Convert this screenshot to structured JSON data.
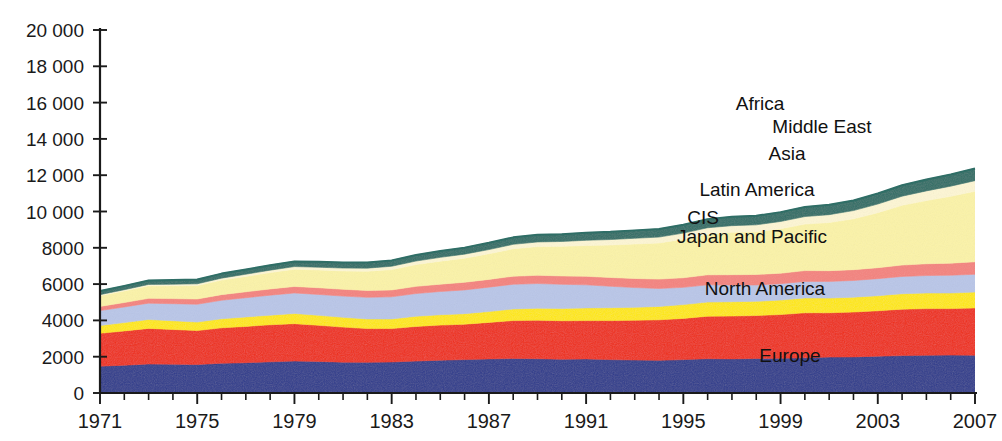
{
  "chart_data": {
    "type": "area",
    "title": "",
    "subtitle": "",
    "xlabel": "",
    "ylabel": "",
    "stacked": true,
    "grid": false,
    "legend_position": "inline-labels",
    "xlim": [
      1971,
      2007
    ],
    "ylim": [
      0,
      20000
    ],
    "ytick_step": 2000,
    "xtick_step": 4,
    "x": [
      1971,
      1972,
      1973,
      1974,
      1975,
      1976,
      1977,
      1978,
      1979,
      1980,
      1981,
      1982,
      1983,
      1984,
      1985,
      1986,
      1987,
      1988,
      1989,
      1990,
      1991,
      1992,
      1993,
      1994,
      1995,
      1996,
      1997,
      1998,
      1999,
      2000,
      2001,
      2002,
      2003,
      2004,
      2005,
      2006,
      2007
    ],
    "xtick_labels": [
      "1971",
      "1975",
      "1979",
      "1983",
      "1987",
      "1991",
      "1995",
      "1999",
      "2003",
      "2007"
    ],
    "ytick_labels": [
      "0",
      "2000",
      "4000",
      "6000",
      "8000",
      "10 000",
      "12 000",
      "14 000",
      "16 000",
      "18 000",
      "20 000"
    ],
    "series": [
      {
        "name": "Europe",
        "color": "#2e3b8c",
        "label_x": 2002,
        "label_y": 1450,
        "values": [
          1480,
          1530,
          1600,
          1590,
          1570,
          1640,
          1670,
          1720,
          1760,
          1740,
          1700,
          1690,
          1710,
          1760,
          1810,
          1840,
          1880,
          1900,
          1890,
          1860,
          1880,
          1840,
          1820,
          1800,
          1840,
          1890,
          1880,
          1900,
          1910,
          1940,
          1980,
          1990,
          2030,
          2060,
          2080,
          2090,
          2080
        ]
      },
      {
        "name": "North America",
        "color": "#ee2d16",
        "label_x": 2001,
        "label_y": 3300,
        "values": [
          1810,
          1890,
          1960,
          1910,
          1870,
          1950,
          2000,
          2040,
          2060,
          1990,
          1930,
          1860,
          1840,
          1910,
          1930,
          1950,
          2010,
          2090,
          2120,
          2120,
          2110,
          2150,
          2190,
          2230,
          2270,
          2340,
          2360,
          2370,
          2410,
          2480,
          2440,
          2470,
          2500,
          2560,
          2570,
          2560,
          2610
        ]
      },
      {
        "name": "Japan and Pacific",
        "color": "#ffe800",
        "label_x": 2000,
        "label_y": 1060,
        "values": [
          430,
          460,
          490,
          480,
          470,
          500,
          520,
          530,
          560,
          550,
          540,
          530,
          530,
          560,
          570,
          580,
          600,
          640,
          660,
          680,
          700,
          710,
          710,
          740,
          760,
          780,
          790,
          780,
          800,
          820,
          810,
          820,
          830,
          850,
          860,
          860,
          870
        ]
      },
      {
        "name": "CIS",
        "color": "#b9c6e8",
        "label_x": 1996,
        "label_y": 1000,
        "values": [
          820,
          860,
          900,
          940,
          980,
          1020,
          1060,
          1100,
          1130,
          1150,
          1170,
          1190,
          1220,
          1250,
          1280,
          1310,
          1340,
          1360,
          1360,
          1330,
          1270,
          1180,
          1090,
          990,
          950,
          950,
          920,
          900,
          900,
          910,
          920,
          920,
          940,
          950,
          960,
          980,
          980
        ]
      },
      {
        "name": "Latin America",
        "color": "#f4837e",
        "label_x": 2000,
        "label_y": 1250,
        "values": [
          230,
          245,
          265,
          280,
          290,
          310,
          325,
          345,
          360,
          370,
          375,
          380,
          380,
          395,
          405,
          420,
          430,
          445,
          455,
          460,
          470,
          485,
          500,
          515,
          530,
          550,
          570,
          580,
          580,
          595,
          590,
          595,
          605,
          630,
          650,
          665,
          690
        ]
      },
      {
        "name": "Asia",
        "color": "#fbf3a8",
        "label_x": 1999,
        "label_y": 2700,
        "values": [
          590,
          640,
          690,
          710,
          740,
          800,
          850,
          900,
          950,
          980,
          1010,
          1060,
          1120,
          1200,
          1270,
          1330,
          1410,
          1510,
          1580,
          1630,
          1700,
          1790,
          1900,
          1990,
          2120,
          2240,
          2330,
          2350,
          2450,
          2560,
          2650,
          2800,
          3030,
          3290,
          3480,
          3680,
          3880
        ]
      },
      {
        "name": "Middle East",
        "color": "#fdf6d4",
        "label_x": 2003,
        "label_y": 1000,
        "values": [
          60,
          68,
          78,
          85,
          95,
          108,
          120,
          133,
          145,
          150,
          158,
          170,
          182,
          195,
          208,
          220,
          232,
          245,
          258,
          268,
          285,
          300,
          315,
          325,
          340,
          355,
          370,
          385,
          400,
          415,
          435,
          455,
          475,
          505,
          535,
          560,
          590
        ]
      },
      {
        "name": "Africa",
        "color": "#2f6e66",
        "label_x": 1996,
        "label_y": 1400,
        "values": [
          200,
          210,
          220,
          230,
          240,
          250,
          262,
          275,
          285,
          295,
          305,
          315,
          325,
          335,
          348,
          360,
          372,
          385,
          395,
          405,
          415,
          425,
          435,
          445,
          460,
          475,
          490,
          500,
          515,
          530,
          545,
          560,
          580,
          605,
          625,
          645,
          670
        ]
      }
    ],
    "series_label_positions": [
      {
        "name": "Africa",
        "x": 760,
        "y": 110
      },
      {
        "name": "Middle East",
        "x": 822,
        "y": 133
      },
      {
        "name": "Asia",
        "x": 787,
        "y": 160
      },
      {
        "name": "Latin America",
        "x": 757,
        "y": 196
      },
      {
        "name": "CIS",
        "x": 703,
        "y": 224
      },
      {
        "name": "Japan and Pacific",
        "x": 752,
        "y": 243
      },
      {
        "name": "North America",
        "x": 765,
        "y": 295
      },
      {
        "name": "Europe",
        "x": 790,
        "y": 362
      }
    ]
  }
}
